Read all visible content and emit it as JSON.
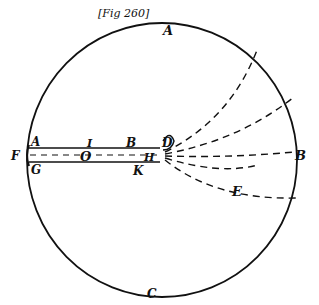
{
  "figure": {
    "caption": "[Fig 260]",
    "colors": {
      "ink": "#111111",
      "background": "#ffffff"
    },
    "circle": {
      "cx": 162,
      "cy": 160,
      "rx": 135,
      "ry": 137
    },
    "labels": {
      "A_top": "A",
      "C_bottom": "C",
      "F_left": "F",
      "A_tube": "A",
      "G_tube": "G",
      "I": "I",
      "O": "O",
      "B_tube": "B",
      "H": "H",
      "K": "K",
      "D": "D",
      "B_right": "B",
      "E": "E"
    }
  }
}
